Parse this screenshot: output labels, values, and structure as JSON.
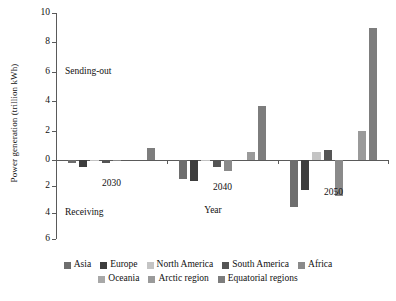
{
  "chart_data": {
    "type": "bar",
    "title": "",
    "xlabel": "Year",
    "ylabel": "Power generation (trillion kWh)",
    "categories": [
      "2030",
      "2040",
      "2050"
    ],
    "ylim": [
      -6,
      10
    ],
    "yticks": [
      10,
      8,
      6,
      4,
      2,
      0,
      -2,
      -4,
      -6
    ],
    "ytick_labels": [
      "10",
      "8",
      "6",
      "4",
      "2",
      "0",
      "2",
      "4",
      "6"
    ],
    "grid": false,
    "legend_position": "bottom",
    "annotations": [
      {
        "text": "Sending-out",
        "y": 6.0
      },
      {
        "text": "Receiving",
        "y": -4.0
      }
    ],
    "series": [
      {
        "name": "Asia",
        "color": "#6e6e6e",
        "values": [
          -0.25,
          -1.45,
          -3.6
        ]
      },
      {
        "name": "Europe",
        "color": "#3d3d3d",
        "values": [
          -0.5,
          -1.6,
          -2.3
        ]
      },
      {
        "name": "North America",
        "color": "#c4c4c4",
        "values": [
          -0.08,
          -0.05,
          0.55
        ]
      },
      {
        "name": "South America",
        "color": "#555555",
        "values": [
          -0.2,
          -0.55,
          0.65
        ]
      },
      {
        "name": "Africa",
        "color": "#8a8a8a",
        "values": [
          -0.05,
          -0.85,
          -2.75
        ]
      },
      {
        "name": "Oceania",
        "color": "#a8a8a8",
        "values": [
          0.0,
          0.0,
          0.0
        ]
      },
      {
        "name": "Arctic region",
        "color": "#9a9a9a",
        "values": [
          0.0,
          0.55,
          2.0
        ]
      },
      {
        "name": "Equatorial regions",
        "color": "#7d7d7d",
        "values": [
          0.8,
          3.7,
          9.0
        ]
      }
    ]
  },
  "legend": {
    "row1": [
      "Asia",
      "Europe",
      "North America",
      "South America",
      "Africa"
    ],
    "row2": [
      "Oceania",
      "Arctic region",
      "Equatorial regions"
    ]
  }
}
